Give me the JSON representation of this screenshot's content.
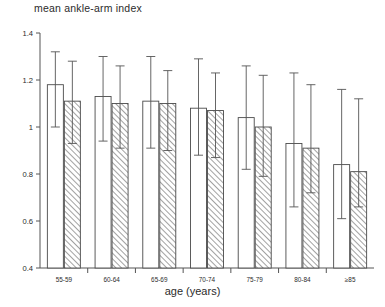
{
  "chart_data": {
    "type": "bar",
    "title": "mean ankle-arm index",
    "xlabel": "age (years)",
    "ylabel": "",
    "ylim": [
      0.4,
      1.4
    ],
    "yticks": [
      0.4,
      0.6,
      0.8,
      1.0,
      1.2,
      1.4
    ],
    "ytick_labels": [
      "0.4",
      "0.6",
      "0.8",
      "1",
      "1.2",
      "1.4"
    ],
    "grid": false,
    "legend": "none",
    "categories": [
      "55-59",
      "60-64",
      "65-69",
      "70-74",
      "75-79",
      "80-84",
      "≥85"
    ],
    "series": [
      {
        "name": "open",
        "fill": "white",
        "values": [
          1.18,
          1.13,
          1.11,
          1.08,
          1.04,
          0.93,
          0.84
        ],
        "err_low": [
          1.0,
          0.94,
          0.91,
          0.88,
          0.82,
          0.66,
          0.61
        ],
        "err_high": [
          1.32,
          1.3,
          1.3,
          1.29,
          1.26,
          1.23,
          1.16
        ]
      },
      {
        "name": "hatched",
        "fill": "hatch",
        "values": [
          1.11,
          1.1,
          1.1,
          1.07,
          1.0,
          0.91,
          0.81
        ],
        "err_low": [
          0.93,
          0.91,
          0.9,
          0.87,
          0.79,
          0.72,
          0.66
        ],
        "err_high": [
          1.28,
          1.26,
          1.24,
          1.23,
          1.22,
          1.18,
          1.12
        ]
      }
    ]
  },
  "axis": {
    "y_tick_labels": [
      "1.4",
      "1.2",
      "1",
      "0.8",
      "0.6",
      "0.4"
    ],
    "x_tick_labels": [
      "55-59",
      "60-64",
      "65-69",
      "70-74",
      "75-79",
      "80-84",
      "≥85"
    ]
  },
  "labels": {
    "title": "mean ankle-arm index",
    "xaxis_title": "age (years)"
  },
  "colors": {
    "axis": "#555555",
    "bar_outline": "#4a4a4a",
    "bar_fill_open": "#ffffff",
    "hatch_line": "#6a6a6a",
    "text": "#2b2b2b"
  }
}
